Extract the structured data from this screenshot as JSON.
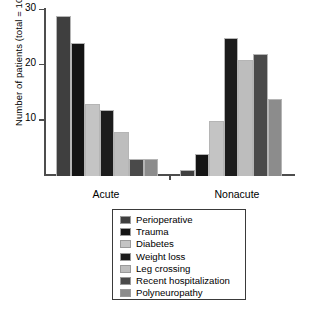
{
  "chart_data": {
    "type": "bar",
    "title": "",
    "xlabel": "",
    "ylabel": "Number of patients (total = 103)",
    "categories": [
      "Acute",
      "Nonacute"
    ],
    "ylim": [
      0,
      30
    ],
    "yticks": [
      10,
      20,
      30
    ],
    "ytick_labels": [
      "10",
      "20",
      "30"
    ],
    "grid": false,
    "legend_position": "below-plot",
    "series": [
      {
        "name": "Perioperative",
        "color": "#3f3f3f",
        "values": [
          29,
          1
        ]
      },
      {
        "name": "Trauma",
        "color": "#141414",
        "values": [
          24,
          4
        ]
      },
      {
        "name": "Diabetes",
        "color": "#c4c4c4",
        "values": [
          13,
          10
        ]
      },
      {
        "name": "Weight loss",
        "color": "#1c1c1c",
        "values": [
          12,
          25
        ]
      },
      {
        "name": "Leg crossing",
        "color": "#bdbdbd",
        "values": [
          8,
          21
        ]
      },
      {
        "name": "Recent hospitalization",
        "color": "#4a4a4a",
        "values": [
          3,
          22
        ]
      },
      {
        "name": "Polyneuropathy",
        "color": "#8c8c8c",
        "values": [
          3,
          14
        ]
      }
    ]
  },
  "legend": {
    "items": [
      "Perioperative",
      "Trauma",
      "Diabetes",
      "Weight loss",
      "Leg crossing",
      "Recent hospitalization",
      "Polyneuropathy"
    ]
  }
}
